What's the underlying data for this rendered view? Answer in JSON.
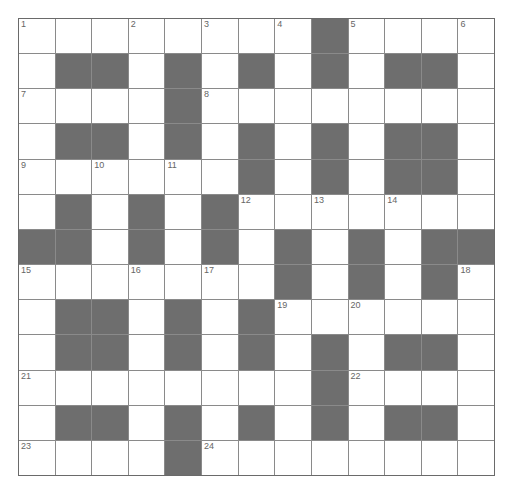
{
  "puzzle": {
    "rows": 13,
    "cols": 13,
    "colors": {
      "block": "#6e6e6e",
      "cell": "#ffffff",
      "line": "#8a8a8a"
    },
    "grid": [
      "........#....",
      ".##.#.#.#.##.",
      "....#........",
      ".##.#.#.#.##.",
      "......#.#.##.",
      ".#.#.#.......",
      "##.#.#.#.#.##",
      ".......#.#.#.",
      ".##.#.#......",
      ".##.#.#.#.##.",
      "........#....",
      ".##.#.#.#.##.",
      "....#........"
    ],
    "numbers": [
      {
        "r": 0,
        "c": 0,
        "n": "1"
      },
      {
        "r": 0,
        "c": 3,
        "n": "2"
      },
      {
        "r": 0,
        "c": 5,
        "n": "3"
      },
      {
        "r": 0,
        "c": 7,
        "n": "4"
      },
      {
        "r": 0,
        "c": 9,
        "n": "5"
      },
      {
        "r": 0,
        "c": 12,
        "n": "6"
      },
      {
        "r": 2,
        "c": 0,
        "n": "7"
      },
      {
        "r": 2,
        "c": 5,
        "n": "8"
      },
      {
        "r": 4,
        "c": 0,
        "n": "9"
      },
      {
        "r": 4,
        "c": 2,
        "n": "10"
      },
      {
        "r": 4,
        "c": 4,
        "n": "11"
      },
      {
        "r": 5,
        "c": 6,
        "n": "12"
      },
      {
        "r": 5,
        "c": 8,
        "n": "13"
      },
      {
        "r": 5,
        "c": 10,
        "n": "14"
      },
      {
        "r": 7,
        "c": 0,
        "n": "15"
      },
      {
        "r": 7,
        "c": 3,
        "n": "16"
      },
      {
        "r": 7,
        "c": 5,
        "n": "17"
      },
      {
        "r": 7,
        "c": 12,
        "n": "18"
      },
      {
        "r": 8,
        "c": 7,
        "n": "19"
      },
      {
        "r": 8,
        "c": 9,
        "n": "20"
      },
      {
        "r": 10,
        "c": 0,
        "n": "21"
      },
      {
        "r": 10,
        "c": 9,
        "n": "22"
      },
      {
        "r": 12,
        "c": 0,
        "n": "23"
      },
      {
        "r": 12,
        "c": 5,
        "n": "24"
      }
    ]
  }
}
